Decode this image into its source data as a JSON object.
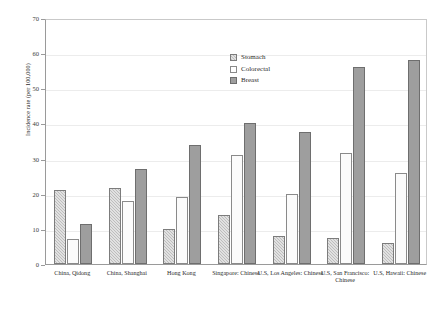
{
  "chart_data": {
    "type": "bar",
    "title": "",
    "xlabel": "",
    "ylabel": "Incidence rate (per 100,000)",
    "ylim": [
      0,
      70
    ],
    "yticks": [
      0,
      10,
      20,
      30,
      40,
      50,
      60,
      70
    ],
    "grid": true,
    "legend_position": "inside-top-center",
    "categories": [
      "China, Qidong",
      "China, Shanghai",
      "Hong Kong",
      "Singapore: Chinese",
      "U.S, Los Angeles: Chinese",
      "U.S, San Francisco: Chinese",
      "U.S, Hawaii: Chinese"
    ],
    "series": [
      {
        "name": "Stomach",
        "color": "#bdbdbd",
        "values": [
          21.0,
          21.5,
          10.0,
          14.0,
          8.0,
          7.5,
          6.0
        ]
      },
      {
        "name": "Colorectal",
        "color": "#fbfbfb",
        "values": [
          7.0,
          18.0,
          19.0,
          31.0,
          20.0,
          31.5,
          26.0
        ]
      },
      {
        "name": "Breast",
        "color": "#9e9e9e",
        "values": [
          11.5,
          27.0,
          34.0,
          40.0,
          37.5,
          56.0,
          58.0
        ]
      }
    ]
  }
}
